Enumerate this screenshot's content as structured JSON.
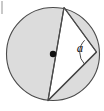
{
  "figure": {
    "kind": "geometry-diagram",
    "width": 104,
    "height": 111,
    "background_color": "#ffffff",
    "colors": {
      "circle_fill": "#dcdcdc",
      "triangle_fill": "#ffffff",
      "stroke": "#4a4a4a",
      "label": "#1a1a1a",
      "center_dot": "#111111",
      "edge_artifact": "#c9c9c9"
    },
    "circle": {
      "center_x": 53,
      "center_y": 54,
      "radius": 46.5
    },
    "center_point": {
      "x": 53,
      "y": 54,
      "radius": 3.2
    },
    "vertices": {
      "top": {
        "x": 64,
        "y": 7.5
      },
      "right": {
        "x": 96.5,
        "y": 52
      },
      "bottom": {
        "x": 48,
        "y": 100.5
      }
    },
    "angle_arc": {
      "center_x": 96.5,
      "center_y": 52,
      "radius": 17
    },
    "labels": {
      "angle": "a",
      "angle_x": 80,
      "angle_y": 46
    },
    "artifact": {
      "x": 1,
      "y": 1,
      "width": 2,
      "height": 13
    }
  }
}
